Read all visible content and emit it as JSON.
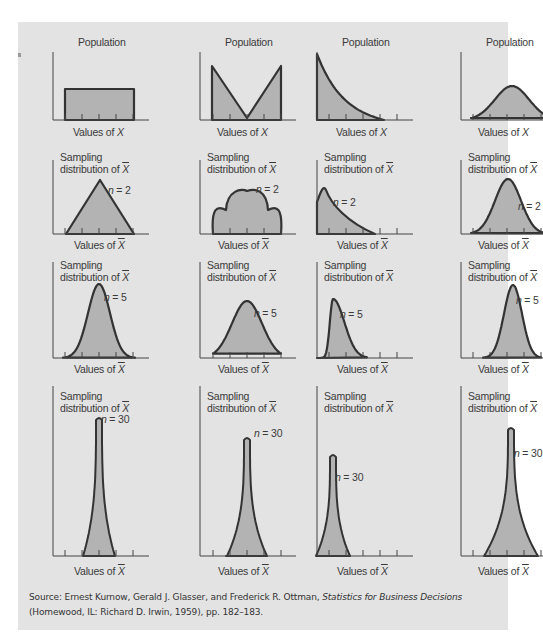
{
  "figure": {
    "side_marker": "a",
    "colors": {
      "panel_background": "#e3e3e3",
      "curve_fill": "#b3b3b3",
      "curve_stroke": "#333333",
      "axis": "#444444",
      "text": "#3a3a3a"
    },
    "columns": [
      "Uniform population",
      "Bimodal (V-shaped) population",
      "Exponential (right-skewed) population",
      "Normal population"
    ],
    "rows": [
      {
        "row": "population",
        "y_label": "Population",
        "x_label_prefix": "Values of ",
        "x_label_var": "X",
        "x_bar": false
      },
      {
        "row": "n=2",
        "y_label_line1": "Sampling",
        "y_label_line2_prefix": "distribution of ",
        "y_label_var": "X",
        "x_label_prefix": "Values of ",
        "x_label_var": "X",
        "x_bar": true,
        "n_label_var": "n",
        "n_label_value": " = 2"
      },
      {
        "row": "n=5",
        "y_label_line1": "Sampling",
        "y_label_line2_prefix": "distribution of ",
        "y_label_var": "X",
        "x_label_prefix": "Values of ",
        "x_label_var": "X",
        "x_bar": true,
        "n_label_var": "n",
        "n_label_value": " = 5"
      },
      {
        "row": "n=30",
        "y_label_line1": "Sampling",
        "y_label_line2_prefix": "distribution of ",
        "y_label_var": "X",
        "x_label_prefix": "Values of ",
        "x_label_var": "X",
        "x_bar": true,
        "n_label_var": "n",
        "n_label_value": " = 30"
      }
    ]
  },
  "chart_data": {
    "type": "area",
    "layout": {
      "grid": "4 rows x 4 columns",
      "legend": "none",
      "axis_ticks": "5 unlabeled tick marks on x-axis"
    },
    "panels": [
      {
        "row": 0,
        "col": 0,
        "ylabel": "Population",
        "xlabel": "Values of X",
        "shape": "uniform (rectangle)",
        "annotation": ""
      },
      {
        "row": 0,
        "col": 1,
        "ylabel": "Population",
        "xlabel": "Values of X",
        "shape": "V-shaped bimodal",
        "annotation": ""
      },
      {
        "row": 0,
        "col": 2,
        "ylabel": "Population",
        "xlabel": "Values of X",
        "shape": "exponential decay (right-skewed)",
        "annotation": ""
      },
      {
        "row": 0,
        "col": 3,
        "ylabel": "Population",
        "xlabel": "Values of X",
        "shape": "normal (bell)",
        "annotation": ""
      },
      {
        "row": 1,
        "col": 0,
        "ylabel": "Sampling distribution of X̄",
        "xlabel": "Values of X̄",
        "shape": "triangular",
        "annotation": "n = 2"
      },
      {
        "row": 1,
        "col": 1,
        "ylabel": "Sampling distribution of X̄",
        "xlabel": "Values of X̄",
        "shape": "trimodal scalloped",
        "annotation": "n = 2"
      },
      {
        "row": 1,
        "col": 2,
        "ylabel": "Sampling distribution of X̄",
        "xlabel": "Values of X̄",
        "shape": "right-skewed with early peak",
        "annotation": "n = 2"
      },
      {
        "row": 1,
        "col": 3,
        "ylabel": "Sampling distribution of X̄",
        "xlabel": "Values of X̄",
        "shape": "normal (bell)",
        "annotation": "n = 2"
      },
      {
        "row": 2,
        "col": 0,
        "ylabel": "Sampling distribution of X̄",
        "xlabel": "Values of X̄",
        "shape": "near-normal, taller",
        "annotation": "n = 5"
      },
      {
        "row": 2,
        "col": 1,
        "ylabel": "Sampling distribution of X̄",
        "xlabel": "Values of X̄",
        "shape": "near-normal",
        "annotation": "n = 5"
      },
      {
        "row": 2,
        "col": 2,
        "ylabel": "Sampling distribution of X̄",
        "xlabel": "Values of X̄",
        "shape": "slightly right-skewed",
        "annotation": "n = 5"
      },
      {
        "row": 2,
        "col": 3,
        "ylabel": "Sampling distribution of X̄",
        "xlabel": "Values of X̄",
        "shape": "normal, narrower",
        "annotation": "n = 5"
      },
      {
        "row": 3,
        "col": 0,
        "ylabel": "Sampling distribution of X̄",
        "xlabel": "Values of X̄",
        "shape": "very narrow normal",
        "annotation": "n = 30"
      },
      {
        "row": 3,
        "col": 1,
        "ylabel": "Sampling distribution of X̄",
        "xlabel": "Values of X̄",
        "shape": "narrow normal",
        "annotation": "n = 30"
      },
      {
        "row": 3,
        "col": 2,
        "ylabel": "Sampling distribution of X̄",
        "xlabel": "Values of X̄",
        "shape": "narrow normal near left",
        "annotation": "n = 30"
      },
      {
        "row": 3,
        "col": 3,
        "ylabel": "Sampling distribution of X̄",
        "xlabel": "Values of X̄",
        "shape": "narrow normal",
        "annotation": "n = 30"
      }
    ]
  },
  "source": {
    "prefix": "Source: Ernest Kurnow, Gerald J. Glasser, and Frederick R. Ottman, ",
    "book_title": "Statistics for Business Decisions",
    "suffix": " (Homewood, IL: Richard D. Irwin, 1959), pp. 182–183."
  }
}
